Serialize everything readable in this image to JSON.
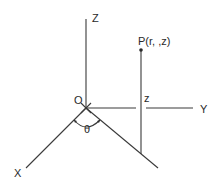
{
  "diagram": {
    "axes": {
      "x_label": "X",
      "y_label": "Y",
      "z_label": "Z",
      "origin_label": "O"
    },
    "point": {
      "label": "P(r, ,z)",
      "height_label": "z"
    },
    "angle": {
      "label": "θ"
    },
    "colors": {
      "line": "#3a3a3a",
      "text": "#2a2a2a",
      "background": "#ffffff"
    }
  }
}
